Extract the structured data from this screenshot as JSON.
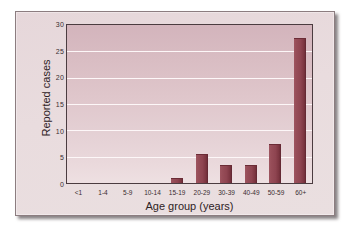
{
  "chart_data": {
    "type": "bar",
    "title": "",
    "xlabel": "Age group (years)",
    "ylabel": "Reported cases",
    "categories": [
      "<1",
      "1-4",
      "5-9",
      "10-14",
      "15-19",
      "20-29",
      "30-39",
      "40-49",
      "50-59",
      "60+"
    ],
    "values": [
      0,
      0,
      0,
      0,
      1,
      5.5,
      3.5,
      3.5,
      7.5,
      27.5
    ],
    "ylim": [
      0,
      30
    ],
    "yticks": [
      0,
      5,
      10,
      15,
      20,
      25,
      30
    ],
    "ytick_labels": [
      "0",
      "5",
      "10",
      "15",
      "20",
      "25",
      "30"
    ],
    "grid": true,
    "legend": false,
    "legend_position": "none",
    "bar_color": "#8e4450",
    "plot_background_top": "#d3b4bc",
    "plot_background_bottom": "#eee0e2",
    "gridline_color": "#fdf7f8",
    "frame_color": "#4b3c40",
    "card_background": "#e8dadd",
    "card_border_color": "#8c7d80"
  }
}
